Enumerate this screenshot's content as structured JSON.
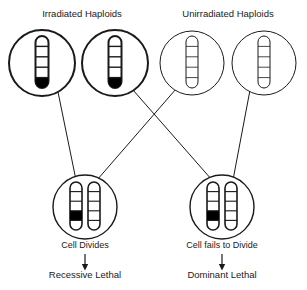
{
  "diagram": {
    "title_left": "Irradiated Haploids",
    "title_right": "Unirradiated Haploids",
    "colors": {
      "ink": "#1a1a1a",
      "background": "#ffffff",
      "lethal_band": "#000000"
    },
    "top_cells": [
      {
        "id": "irradiated-haploid-1",
        "group": "irradiated",
        "cx": 42,
        "cy": 63,
        "r": 33,
        "stroke_width": 2,
        "chromosomes": [
          {
            "segments": 5,
            "dark_segment": 5,
            "stroke_width": 2,
            "x": 42,
            "top": 36,
            "height": 52,
            "width": 13
          }
        ]
      },
      {
        "id": "irradiated-haploid-2",
        "group": "irradiated",
        "cx": 115,
        "cy": 63,
        "r": 33,
        "stroke_width": 2,
        "chromosomes": [
          {
            "segments": 5,
            "dark_segment": 5,
            "stroke_width": 2,
            "x": 115,
            "top": 36,
            "height": 52,
            "width": 13
          }
        ]
      },
      {
        "id": "unirradiated-haploid-1",
        "group": "unirradiated",
        "cx": 192,
        "cy": 63,
        "r": 32,
        "stroke_width": 1,
        "chromosomes": [
          {
            "segments": 5,
            "dark_segment": 0,
            "stroke_width": 1,
            "x": 192,
            "top": 36,
            "height": 52,
            "width": 12
          }
        ]
      },
      {
        "id": "unirradiated-haploid-2",
        "group": "unirradiated",
        "cx": 264,
        "cy": 63,
        "r": 32,
        "stroke_width": 1,
        "chromosomes": [
          {
            "segments": 5,
            "dark_segment": 0,
            "stroke_width": 1,
            "x": 264,
            "top": 36,
            "height": 52,
            "width": 12
          }
        ]
      }
    ],
    "bottom_cells": [
      {
        "id": "zygote-divides",
        "cx": 85,
        "cy": 207,
        "r": 32,
        "stroke_width": 1.4,
        "caption": "Cell Divides",
        "caption_y": 248,
        "outcome": "Recessive Lethal",
        "outcome_y": 278,
        "arrow_from_y": 254,
        "arrow_to_y": 270,
        "chromosomes": [
          {
            "segments": 5,
            "dark_segment": 4,
            "stroke_width": 1.6,
            "x": 76,
            "top": 182,
            "height": 48,
            "width": 12
          },
          {
            "segments": 5,
            "dark_segment": 0,
            "stroke_width": 1.6,
            "x": 94,
            "top": 182,
            "height": 48,
            "width": 12
          }
        ]
      },
      {
        "id": "zygote-fails-to-divide",
        "cx": 222,
        "cy": 207,
        "r": 32,
        "stroke_width": 1.4,
        "caption": "Cell fails to Divide",
        "caption_y": 248,
        "outcome": "Dominant Lethal",
        "outcome_y": 278,
        "arrow_from_y": 254,
        "arrow_to_y": 270,
        "chromosomes": [
          {
            "segments": 5,
            "dark_segment": 4,
            "stroke_width": 1.6,
            "x": 213,
            "top": 182,
            "height": 48,
            "width": 12
          },
          {
            "segments": 5,
            "dark_segment": 0,
            "stroke_width": 1.6,
            "x": 231,
            "top": 182,
            "height": 48,
            "width": 12
          }
        ]
      }
    ],
    "crosses": [
      {
        "id": "cross-irradiated1-to-left",
        "from": "irradiated-haploid-1",
        "to": "zygote-divides",
        "x1": 58,
        "y1": 92,
        "x2": 76,
        "y2": 180
      },
      {
        "id": "cross-unirradiated1-to-left",
        "from": "unirradiated-haploid-1",
        "to": "zygote-divides",
        "x1": 176,
        "y1": 89,
        "x2": 97,
        "y2": 180
      },
      {
        "id": "cross-irradiated2-to-right",
        "from": "irradiated-haploid-2",
        "to": "zygote-fails-to-divide",
        "x1": 133,
        "y1": 90,
        "x2": 212,
        "y2": 180
      },
      {
        "id": "cross-unirradiated2-to-right",
        "from": "unirradiated-haploid-2",
        "to": "zygote-fails-to-divide",
        "x1": 250,
        "y1": 90,
        "x2": 233,
        "y2": 180
      }
    ],
    "header_positions": {
      "left_x": 82,
      "left_y": 17,
      "right_x": 228,
      "right_y": 17
    }
  },
  "chart_data": {
    "type": "diagram",
    "nodes": [
      {
        "label": "Irradiated Haploids",
        "count": 2,
        "marker": "black terminal band on chromosome"
      },
      {
        "label": "Unirradiated Haploids",
        "count": 2,
        "marker": "no band"
      },
      {
        "label": "Cell Divides",
        "outcome": "Recessive Lethal"
      },
      {
        "label": "Cell fails to Divide",
        "outcome": "Dominant Lethal"
      }
    ],
    "edges": [
      {
        "from": "Irradiated Haploid 1",
        "to": "Cell Divides"
      },
      {
        "from": "Unirradiated Haploid 1",
        "to": "Cell Divides"
      },
      {
        "from": "Irradiated Haploid 2",
        "to": "Cell fails to Divide"
      },
      {
        "from": "Unirradiated Haploid 2",
        "to": "Cell fails to Divide"
      }
    ]
  }
}
